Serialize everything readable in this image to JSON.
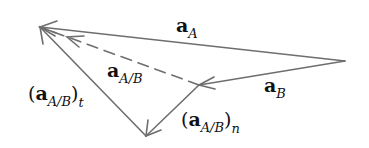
{
  "diagram": {
    "type": "vector-triangle",
    "stroke_color": "#6e6e6e",
    "points": {
      "tip": [
        40,
        27
      ],
      "right": [
        345,
        61
      ],
      "junction": [
        199,
        85
      ],
      "bottom": [
        146,
        136
      ]
    },
    "vectors": [
      {
        "id": "a_A",
        "from": "right",
        "to": "tip",
        "style": "solid"
      },
      {
        "id": "a_B",
        "from": "right",
        "to": "junction",
        "style": "solid"
      },
      {
        "id": "a_A_B",
        "from": "junction",
        "to": "tip",
        "style": "dashed"
      },
      {
        "id": "a_A_B_n",
        "from": "junction",
        "to": "bottom",
        "style": "solid"
      },
      {
        "id": "a_A_B_t",
        "from": "bottom",
        "to": "tip",
        "style": "solid"
      }
    ],
    "labels": {
      "a_A": {
        "bold": "a",
        "sub": "A",
        "pre": "",
        "post": "",
        "post_sub": ""
      },
      "a_A_B": {
        "bold": "a",
        "sub": "A/B",
        "pre": "",
        "post": "",
        "post_sub": ""
      },
      "a_B": {
        "bold": "a",
        "sub": "B",
        "pre": "",
        "post": "",
        "post_sub": ""
      },
      "a_A_B_t": {
        "pre": "(",
        "bold": "a",
        "sub": "A/B",
        "post": ")",
        "post_sub": "t"
      },
      "a_A_B_n": {
        "pre": "(",
        "bold": "a",
        "sub": "A/B",
        "post": ")",
        "post_sub": "n"
      }
    }
  }
}
